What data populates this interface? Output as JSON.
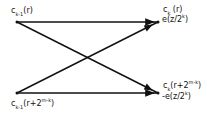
{
  "diagram": {
    "type": "butterfly",
    "nodes": {
      "top_left": {
        "var": "c",
        "sub": "k-1",
        "arg": "(r)"
      },
      "bottom_left": {
        "var": "c",
        "sub": "k-1",
        "arg_pre": "(r+2",
        "sup": "m-k",
        "arg_post": ")"
      },
      "top_right": {
        "var": "c",
        "sub": "k",
        "arg": " (r)",
        "weight_pre": "e(z/2",
        "weight_sup": "k",
        "weight_post": ")"
      },
      "bottom_right": {
        "var": "c",
        "sub": "k",
        "arg_pre": "(r+2",
        "sup": "m-k",
        "arg_post": ")",
        "weight_pre": "-e(z/2",
        "weight_sup": "k",
        "weight_post": ")"
      }
    },
    "edges": [
      {
        "from": "top_left",
        "to": "top_right"
      },
      {
        "from": "top_left",
        "to": "bottom_right"
      },
      {
        "from": "bottom_left",
        "to": "top_right"
      },
      {
        "from": "bottom_left",
        "to": "bottom_right"
      }
    ],
    "colors": {
      "line": "#111111",
      "background": "#ffffff"
    }
  }
}
